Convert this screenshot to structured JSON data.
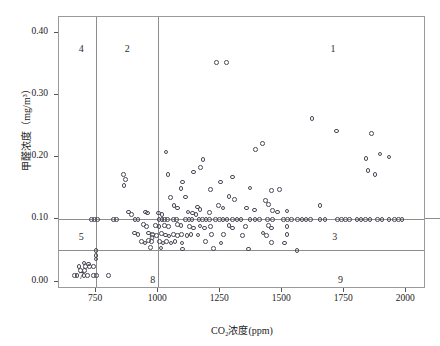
{
  "chart_data": {
    "type": "scatter",
    "title": "",
    "xlabel": "CO₂浓度(ppm)",
    "ylabel": "甲醛浓度（mg/m³）",
    "xlim": [
      600,
      2080
    ],
    "ylim": [
      -0.012,
      0.425
    ],
    "grid": false,
    "legend": false,
    "xticks": [
      750,
      1000,
      1250,
      1500,
      1750,
      2000
    ],
    "xtick_labels": [
      "750",
      "1000",
      "1250",
      "1500",
      "1750",
      "2000"
    ],
    "yticks": [
      0.0,
      0.1,
      0.2,
      0.3,
      0.4
    ],
    "ytick_labels": [
      "0.00",
      "0.10",
      "0.20",
      "0.30",
      "0.40"
    ],
    "reference_lines": {
      "vertical": [
        750,
        1000
      ],
      "horizontal": [
        0.1,
        0.05
      ]
    },
    "region_labels": [
      {
        "text": "4",
        "x": 690,
        "y": 0.375
      },
      {
        "text": "2",
        "x": 875,
        "y": 0.375
      },
      {
        "text": "1",
        "x": 1705,
        "y": 0.375
      },
      {
        "text": "5",
        "x": 690,
        "y": 0.0725
      },
      {
        "text": "6",
        "x": 975,
        "y": 0.0725
      },
      {
        "text": "3",
        "x": 1712,
        "y": 0.0725
      },
      {
        "text": "7",
        "x": 690,
        "y": 0.0105
      },
      {
        "text": "8",
        "x": 978,
        "y": 0.0045
      },
      {
        "text": "9",
        "x": 1735,
        "y": 0.0045
      }
    ],
    "points": [
      [
        1234,
        0.352
      ],
      [
        1276,
        0.352
      ],
      [
        1620,
        0.262
      ],
      [
        1718,
        0.242
      ],
      [
        1860,
        0.238
      ],
      [
        1420,
        0.222
      ],
      [
        1392,
        0.212
      ],
      [
        1895,
        0.205
      ],
      [
        1930,
        0.2
      ],
      [
        1838,
        0.198
      ],
      [
        1846,
        0.178
      ],
      [
        1874,
        0.172
      ],
      [
        1032,
        0.208
      ],
      [
        1180,
        0.196
      ],
      [
        1170,
        0.183
      ],
      [
        1652,
        0.122
      ],
      [
        860,
        0.172
      ],
      [
        868,
        0.164
      ],
      [
        862,
        0.154
      ],
      [
        1040,
        0.172
      ],
      [
        1142,
        0.176
      ],
      [
        1300,
        0.168
      ],
      [
        1252,
        0.16
      ],
      [
        1098,
        0.16
      ],
      [
        1092,
        0.149
      ],
      [
        1210,
        0.148
      ],
      [
        1370,
        0.15
      ],
      [
        1456,
        0.146
      ],
      [
        1490,
        0.148
      ],
      [
        1110,
        0.136
      ],
      [
        1050,
        0.135
      ],
      [
        1286,
        0.137
      ],
      [
        1308,
        0.132
      ],
      [
        1432,
        0.13
      ],
      [
        1444,
        0.124
      ],
      [
        1064,
        0.122
      ],
      [
        1078,
        0.118
      ],
      [
        1158,
        0.12
      ],
      [
        1168,
        0.116
      ],
      [
        1244,
        0.122
      ],
      [
        1262,
        0.118
      ],
      [
        1356,
        0.118
      ],
      [
        1388,
        0.115
      ],
      [
        880,
        0.112
      ],
      [
        892,
        0.108
      ],
      [
        948,
        0.112
      ],
      [
        958,
        0.11
      ],
      [
        1002,
        0.11
      ],
      [
        1016,
        0.108
      ],
      [
        1120,
        0.112
      ],
      [
        1138,
        0.11
      ],
      [
        1152,
        0.108
      ],
      [
        1206,
        0.111
      ],
      [
        1462,
        0.114
      ],
      [
        1480,
        0.112
      ],
      [
        1520,
        0.113
      ],
      [
        730,
        0.1
      ],
      [
        742,
        0.1
      ],
      [
        756,
        0.1
      ],
      [
        820,
        0.1
      ],
      [
        832,
        0.1
      ],
      [
        906,
        0.1
      ],
      [
        918,
        0.1
      ],
      [
        1004,
        0.1
      ],
      [
        1016,
        0.1
      ],
      [
        1026,
        0.1
      ],
      [
        1038,
        0.1
      ],
      [
        1062,
        0.1
      ],
      [
        1074,
        0.1
      ],
      [
        1110,
        0.1
      ],
      [
        1124,
        0.1
      ],
      [
        1136,
        0.1
      ],
      [
        1164,
        0.1
      ],
      [
        1178,
        0.1
      ],
      [
        1192,
        0.1
      ],
      [
        1206,
        0.1
      ],
      [
        1230,
        0.1
      ],
      [
        1248,
        0.1
      ],
      [
        1262,
        0.1
      ],
      [
        1278,
        0.1
      ],
      [
        1300,
        0.1
      ],
      [
        1318,
        0.1
      ],
      [
        1334,
        0.1
      ],
      [
        1370,
        0.1
      ],
      [
        1390,
        0.1
      ],
      [
        1408,
        0.1
      ],
      [
        1440,
        0.1
      ],
      [
        1460,
        0.1
      ],
      [
        1506,
        0.1
      ],
      [
        1522,
        0.1
      ],
      [
        1538,
        0.1
      ],
      [
        1562,
        0.1
      ],
      [
        1580,
        0.1
      ],
      [
        1596,
        0.1
      ],
      [
        1614,
        0.1
      ],
      [
        1652,
        0.1
      ],
      [
        1672,
        0.1
      ],
      [
        1724,
        0.1
      ],
      [
        1740,
        0.1
      ],
      [
        1756,
        0.1
      ],
      [
        1772,
        0.1
      ],
      [
        1802,
        0.1
      ],
      [
        1818,
        0.1
      ],
      [
        1836,
        0.1
      ],
      [
        1854,
        0.1
      ],
      [
        1884,
        0.1
      ],
      [
        1902,
        0.1
      ],
      [
        1930,
        0.1
      ],
      [
        1952,
        0.1
      ],
      [
        1968,
        0.1
      ],
      [
        1984,
        0.1
      ],
      [
        940,
        0.092
      ],
      [
        952,
        0.088
      ],
      [
        990,
        0.09
      ],
      [
        1004,
        0.088
      ],
      [
        1026,
        0.09
      ],
      [
        1042,
        0.088
      ],
      [
        1078,
        0.092
      ],
      [
        1092,
        0.09
      ],
      [
        1126,
        0.088
      ],
      [
        1142,
        0.086
      ],
      [
        1168,
        0.089
      ],
      [
        1186,
        0.086
      ],
      [
        1212,
        0.088
      ],
      [
        1286,
        0.09
      ],
      [
        1300,
        0.086
      ],
      [
        1352,
        0.088
      ],
      [
        1444,
        0.09
      ],
      [
        1456,
        0.086
      ],
      [
        1520,
        0.088
      ],
      [
        904,
        0.078
      ],
      [
        918,
        0.076
      ],
      [
        962,
        0.078
      ],
      [
        978,
        0.076
      ],
      [
        992,
        0.074
      ],
      [
        1014,
        0.077
      ],
      [
        1030,
        0.075
      ],
      [
        1044,
        0.073
      ],
      [
        1062,
        0.076
      ],
      [
        1078,
        0.074
      ],
      [
        1094,
        0.076
      ],
      [
        1116,
        0.074
      ],
      [
        1132,
        0.076
      ],
      [
        1160,
        0.075
      ],
      [
        1216,
        0.076
      ],
      [
        1264,
        0.076
      ],
      [
        1340,
        0.074
      ],
      [
        1422,
        0.078
      ],
      [
        1436,
        0.074
      ],
      [
        1520,
        0.076
      ],
      [
        932,
        0.064
      ],
      [
        946,
        0.062
      ],
      [
        960,
        0.066
      ],
      [
        974,
        0.064
      ],
      [
        1006,
        0.064
      ],
      [
        1020,
        0.062
      ],
      [
        1034,
        0.064
      ],
      [
        1052,
        0.062
      ],
      [
        1068,
        0.064
      ],
      [
        1096,
        0.062
      ],
      [
        1190,
        0.064
      ],
      [
        1254,
        0.062
      ],
      [
        1456,
        0.063
      ],
      [
        1510,
        0.062
      ],
      [
        970,
        0.055
      ],
      [
        1012,
        0.054
      ],
      [
        1098,
        0.052
      ],
      [
        1222,
        0.053
      ],
      [
        1364,
        0.052
      ],
      [
        1560,
        0.05
      ],
      [
        750,
        0.05
      ],
      [
        750,
        0.042
      ],
      [
        750,
        0.036
      ],
      [
        700,
        0.03
      ],
      [
        720,
        0.028
      ],
      [
        680,
        0.024
      ],
      [
        706,
        0.024
      ],
      [
        722,
        0.024
      ],
      [
        740,
        0.024
      ],
      [
        686,
        0.018
      ],
      [
        702,
        0.018
      ],
      [
        662,
        0.01
      ],
      [
        672,
        0.01
      ],
      [
        700,
        0.01
      ],
      [
        714,
        0.01
      ],
      [
        740,
        0.01
      ],
      [
        752,
        0.01
      ],
      [
        800,
        0.01
      ]
    ]
  }
}
